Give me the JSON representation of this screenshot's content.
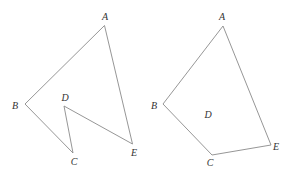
{
  "figures": [
    {
      "name": "concave-pentagon",
      "vertices": {
        "A": {
          "x": 104.5,
          "y": 25.5,
          "lx": 105,
          "ly": 20
        },
        "B": {
          "x": 25,
          "y": 104,
          "lx": 15,
          "ly": 109
        },
        "C": {
          "x": 73,
          "y": 153,
          "lx": 74,
          "ly": 165
        },
        "D": {
          "x": 64,
          "y": 106,
          "lx": 65,
          "ly": 101
        },
        "E": {
          "x": 132.5,
          "y": 144,
          "lx": 134,
          "ly": 156
        }
      },
      "order": [
        "A",
        "B",
        "C",
        "D",
        "E"
      ],
      "labels": {
        "A": "A",
        "B": "B",
        "C": "C",
        "D": "D",
        "E": "E"
      }
    },
    {
      "name": "convex-quadrilateral",
      "vertices": {
        "A": {
          "x": 223,
          "y": 26,
          "lx": 222,
          "ly": 20
        },
        "B": {
          "x": 163,
          "y": 104,
          "lx": 154,
          "ly": 109
        },
        "C": {
          "x": 212,
          "y": 155,
          "lx": 210,
          "ly": 166
        },
        "E": {
          "x": 271,
          "y": 145,
          "lx": 276,
          "ly": 150
        },
        "D": {
          "x": 209,
          "y": 115,
          "lx": 208,
          "ly": 118
        }
      },
      "order": [
        "A",
        "B",
        "C",
        "E"
      ],
      "labels": {
        "A": "A",
        "B": "B",
        "C": "C",
        "D": "D",
        "E": "E"
      }
    }
  ],
  "colors": {
    "edge": "#8a8a8a",
    "label": "#333333",
    "background": "#ffffff"
  }
}
